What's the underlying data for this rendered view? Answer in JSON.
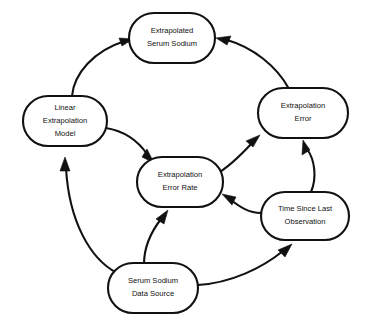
{
  "diagram": {
    "background_color": "#ffffff",
    "line_color": "#111111",
    "node_fill": "#ffffff",
    "nodes": [
      {
        "id": "extrapolated_serum_sodium",
        "lines": [
          "Extrapolated",
          "Serum Sodium"
        ],
        "cx": 172,
        "cy": 38,
        "rx": 43,
        "ry": 25
      },
      {
        "id": "linear_extrapolation_model",
        "lines": [
          "Linear",
          "Extrapolation",
          "Model"
        ],
        "cx": 65,
        "cy": 121,
        "rx": 42,
        "ry": 25
      },
      {
        "id": "extrapolation_error",
        "lines": [
          "Extrapolation",
          "Error"
        ],
        "cx": 303,
        "cy": 113,
        "rx": 45,
        "ry": 25
      },
      {
        "id": "extrapolation_error_rate",
        "lines": [
          "Extrapolation",
          "Error Rate"
        ],
        "cx": 180,
        "cy": 182,
        "rx": 43,
        "ry": 25
      },
      {
        "id": "time_since_last_observation",
        "lines": [
          "Time Since Last",
          "Observation"
        ],
        "cx": 305,
        "cy": 216,
        "rx": 44,
        "ry": 24
      },
      {
        "id": "serum_sodium_data_source",
        "lines": [
          "Serum Sodium",
          "Data Source"
        ],
        "cx": 153,
        "cy": 288,
        "rx": 45,
        "ry": 25
      }
    ],
    "edges": [
      {
        "id": "model-to-extrapolated-sodium",
        "from": "linear_extrapolation_model",
        "to": "extrapolated_serum_sodium"
      },
      {
        "id": "error-to-extrapolated-sodium",
        "from": "extrapolation_error",
        "to": "extrapolated_serum_sodium"
      },
      {
        "id": "model-to-error-rate",
        "from": "linear_extrapolation_model",
        "to": "extrapolation_error_rate"
      },
      {
        "id": "error-rate-to-error",
        "from": "extrapolation_error_rate",
        "to": "extrapolation_error"
      },
      {
        "id": "time-to-error",
        "from": "time_since_last_observation",
        "to": "extrapolation_error"
      },
      {
        "id": "time-to-error-rate",
        "from": "time_since_last_observation",
        "to": "extrapolation_error_rate"
      },
      {
        "id": "data-source-to-model",
        "from": "serum_sodium_data_source",
        "to": "linear_extrapolation_model"
      },
      {
        "id": "data-source-to-error-rate",
        "from": "serum_sodium_data_source",
        "to": "extrapolation_error_rate"
      },
      {
        "id": "data-source-to-time",
        "from": "serum_sodium_data_source",
        "to": "time_since_last_observation"
      }
    ]
  }
}
